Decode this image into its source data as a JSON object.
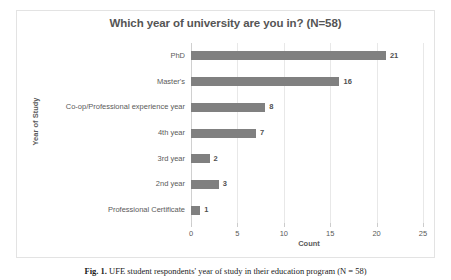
{
  "figure": {
    "caption_label": "Fig. 1.",
    "caption_text": "UFE student respondents' year of study in their education program (N = 58)"
  },
  "chart_data": {
    "type": "bar",
    "orientation": "horizontal",
    "title": "Which year of university are you in? (N=58)",
    "xlabel": "Count",
    "ylabel": "Year of Study",
    "categories": [
      "PhD",
      "Master's",
      "Co-op/Professional experience year",
      "4th year",
      "3rd year",
      "2nd year",
      "Professional Certificate"
    ],
    "values": [
      21,
      16,
      8,
      7,
      2,
      3,
      1
    ],
    "data_labels": [
      "21",
      "16",
      "8",
      "7",
      "2",
      "3",
      "1"
    ],
    "xlim": [
      0,
      25
    ],
    "xticks": [
      0,
      5,
      10,
      15,
      20,
      25
    ],
    "xtick_labels": [
      "0",
      "5",
      "10",
      "15",
      "20",
      "25"
    ],
    "grid": "vertical",
    "legend": "none",
    "bar_color": "#808080",
    "plot_background": "#ffffff",
    "frame_color": "#e3e3e3",
    "gridline_color": "#e8e8e8",
    "text_color": "#5a5a5a"
  }
}
